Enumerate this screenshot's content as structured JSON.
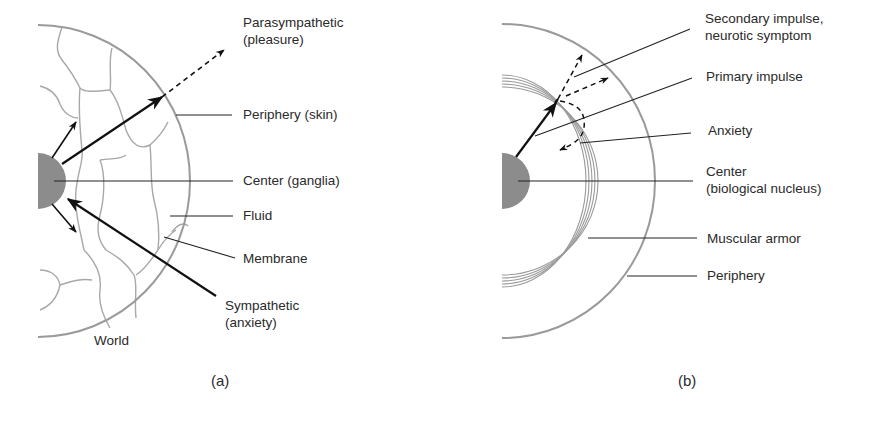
{
  "panel_a": {
    "caption": "(a)",
    "labels": {
      "parasympathetic_line1": "Parasympathetic",
      "parasympathetic_line2": "(pleasure)",
      "periphery": "Periphery (skin)",
      "center": "Center (ganglia)",
      "fluid": "Fluid",
      "membrane": "Membrane",
      "sympathetic_line1": "Sympathetic",
      "sympathetic_line2": "(anxiety)",
      "world": "World"
    }
  },
  "panel_b": {
    "caption": "(b)",
    "labels": {
      "secondary_line1": "Secondary impulse,",
      "secondary_line2": "neurotic symptom",
      "primary": "Primary impulse",
      "anxiety": "Anxiety",
      "center_line1": "Center",
      "center_line2": "(biological nucleus)",
      "muscular_armor": "Muscular armor",
      "periphery": "Periphery"
    }
  },
  "colors": {
    "outline": "#9a9a9a",
    "nucleus": "#8c8c8c",
    "arrow": "#111111",
    "text": "#2a2a2a"
  }
}
